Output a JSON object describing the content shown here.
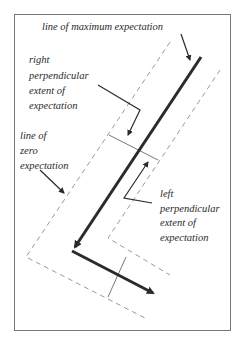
{
  "labels": {
    "max_line": "line of maximum expectation",
    "right_extent": [
      "right",
      "perpendicular",
      "extent of",
      "expectation"
    ],
    "zero_line": [
      "line of",
      "zero",
      "expectation"
    ],
    "left_extent": [
      "left",
      "perpendicular",
      "extent of",
      "expectation"
    ]
  },
  "colors": {
    "frame": "#777777",
    "main_line": "#2b2b2b",
    "dashed": "#9a9a9a",
    "text": "#2a2a2a"
  }
}
